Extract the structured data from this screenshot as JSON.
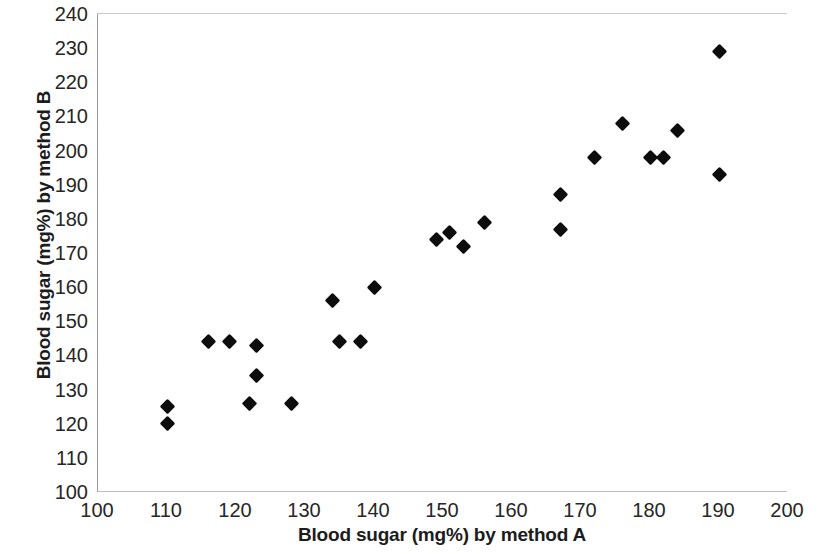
{
  "chart_data": {
    "type": "scatter",
    "title": "",
    "xlabel": "Blood sugar (mg%) by method  A",
    "ylabel": "Blood sugar (mg%) by method B",
    "xlim": [
      100,
      200
    ],
    "ylim": [
      100,
      240
    ],
    "xticks": [
      100,
      110,
      120,
      130,
      140,
      150,
      160,
      170,
      180,
      190,
      200
    ],
    "yticks": [
      100,
      110,
      120,
      130,
      140,
      150,
      160,
      170,
      180,
      190,
      200,
      210,
      220,
      230,
      240
    ],
    "grid": false,
    "legend": null,
    "marker": "diamond",
    "marker_color": "#0d0d0d",
    "points": [
      {
        "x": 110,
        "y": 125
      },
      {
        "x": 110,
        "y": 120
      },
      {
        "x": 116,
        "y": 144
      },
      {
        "x": 119,
        "y": 144
      },
      {
        "x": 123,
        "y": 143
      },
      {
        "x": 123,
        "y": 134
      },
      {
        "x": 122,
        "y": 126
      },
      {
        "x": 128,
        "y": 126
      },
      {
        "x": 134,
        "y": 156
      },
      {
        "x": 135,
        "y": 144
      },
      {
        "x": 138,
        "y": 144
      },
      {
        "x": 140,
        "y": 160
      },
      {
        "x": 149,
        "y": 174
      },
      {
        "x": 151,
        "y": 176
      },
      {
        "x": 153,
        "y": 172
      },
      {
        "x": 156,
        "y": 179
      },
      {
        "x": 167,
        "y": 187
      },
      {
        "x": 167,
        "y": 177
      },
      {
        "x": 172,
        "y": 198
      },
      {
        "x": 176,
        "y": 208
      },
      {
        "x": 180,
        "y": 198
      },
      {
        "x": 182,
        "y": 198
      },
      {
        "x": 184,
        "y": 206
      },
      {
        "x": 190,
        "y": 229
      },
      {
        "x": 190,
        "y": 193
      }
    ]
  },
  "axes": {
    "y_title": "Blood sugar (mg%) by method B",
    "x_title": "Blood sugar (mg%) by method  A"
  }
}
